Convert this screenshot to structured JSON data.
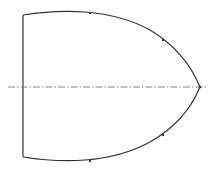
{
  "diagram": {
    "colors": {
      "stroke": "#333333",
      "axis": "#666666",
      "background": "#ffffff"
    },
    "base": {
      "x": 23,
      "y1": 15,
      "y2": 157
    },
    "tip": {
      "x": 200,
      "y": 87
    },
    "axis": {
      "x1": 8,
      "x2": 206,
      "y": 87
    },
    "markers": [
      {
        "x": 90,
        "y": 13
      },
      {
        "x": 163,
        "y": 40
      },
      {
        "x": 163,
        "y": 135
      },
      {
        "x": 90,
        "y": 161
      }
    ]
  }
}
